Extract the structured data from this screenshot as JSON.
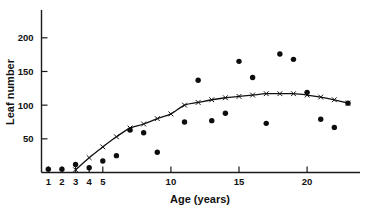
{
  "chart_data": {
    "type": "scatter",
    "title": "",
    "xlabel": "Age  (years)",
    "ylabel": "Leaf number",
    "xlim": [
      0.3,
      23.8
    ],
    "ylim": [
      0,
      225
    ],
    "xticks": [
      1,
      2,
      3,
      4,
      5,
      10,
      15,
      20
    ],
    "xticklabels": [
      "1",
      "2",
      "3",
      "4",
      "5",
      "10",
      "15",
      "20"
    ],
    "yticks": [
      50,
      100,
      150,
      200
    ],
    "yticklabels": [
      "50",
      "100",
      "150",
      "200"
    ],
    "grid": false,
    "legend": false,
    "series": [
      {
        "name": "Observed leaf number",
        "marker": "filled-circle",
        "color": "#0d0d0d",
        "x": [
          1,
          2,
          3,
          4,
          5,
          6,
          7,
          8,
          9,
          11,
          12,
          13,
          14,
          15,
          16,
          17,
          18,
          19,
          20,
          21,
          22,
          23
        ],
        "values": [
          5,
          5,
          12,
          7,
          17,
          25,
          63,
          59,
          30,
          75,
          137,
          77,
          88,
          165,
          141,
          73,
          176,
          168,
          119,
          79,
          67,
          103
        ]
      },
      {
        "name": "Fitted curve",
        "marker": "x",
        "color": "#111111",
        "x": [
          3,
          4,
          5,
          6,
          7,
          8,
          9,
          10,
          11,
          12,
          13,
          14,
          15,
          16,
          17,
          18,
          19,
          20,
          21,
          22,
          23
        ],
        "values": [
          4,
          22,
          38,
          53,
          66,
          72,
          80,
          87,
          100,
          104,
          108,
          111,
          113,
          115,
          117,
          117,
          117,
          115,
          112,
          108,
          103
        ]
      }
    ]
  },
  "figure": {
    "xlabel": "Age  (years)",
    "ylabel": "Leaf number"
  }
}
